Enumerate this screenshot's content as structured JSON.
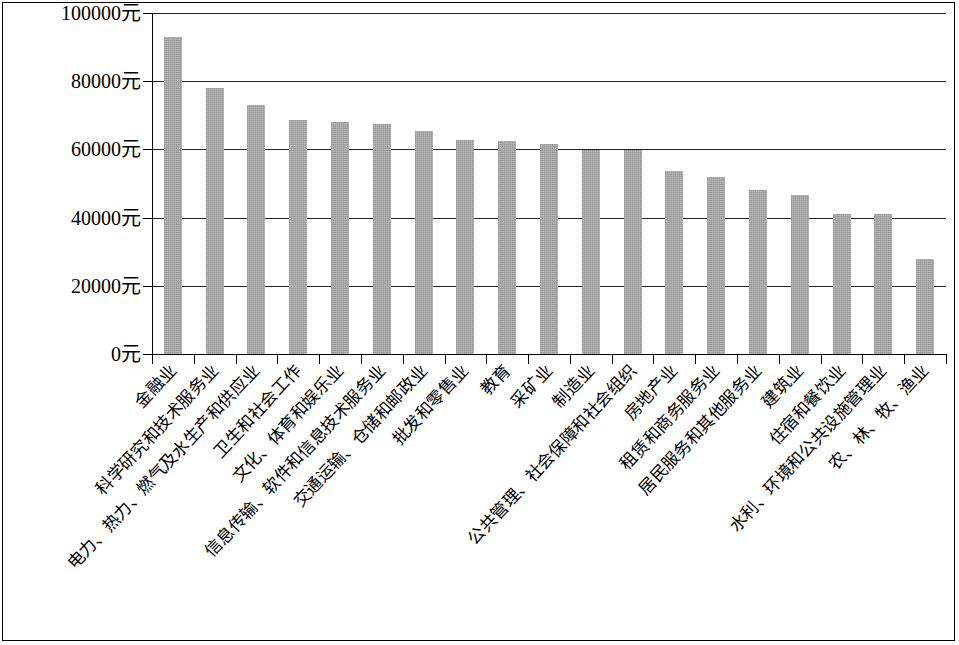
{
  "chart_data": {
    "type": "bar",
    "title": "",
    "subtitle": "",
    "xlabel": "",
    "ylabel": "",
    "unit": "元",
    "ylim": [
      0,
      100000
    ],
    "ytick_values": [
      0,
      20000,
      40000,
      60000,
      80000,
      100000
    ],
    "ytick_labels": [
      "0元",
      "20000元",
      "40000元",
      "60000元",
      "80000元",
      "100000元"
    ],
    "grid": true,
    "grid_axis": "y",
    "legend": "none",
    "bar_color": "#a9a9a9",
    "axis_color": "#000000",
    "categories": [
      "金融业",
      "科学研究和技术服务业",
      "电力、热力、燃气及水生产和供应业",
      "卫生和社会工作",
      "文化、体育和娱乐业",
      "信息传输、软件和信息技术服务业",
      "交通运输、仓储和邮政业",
      "批发和零售业",
      "教育",
      "采矿业",
      "制造业",
      "公共管理、社会保障和社会组织",
      "房地产业",
      "租赁和商务服务业",
      "居民服务和其他服务业",
      "建筑业",
      "住宿和餐饮业",
      "水利、环境和公共设施管理业",
      "农、林、牧、渔业"
    ],
    "values": [
      93000,
      78000,
      73000,
      68500,
      68000,
      67500,
      65500,
      62800,
      62600,
      61500,
      59800,
      59800,
      53800,
      52000,
      48000,
      46500,
      41000,
      41000,
      28000
    ]
  }
}
